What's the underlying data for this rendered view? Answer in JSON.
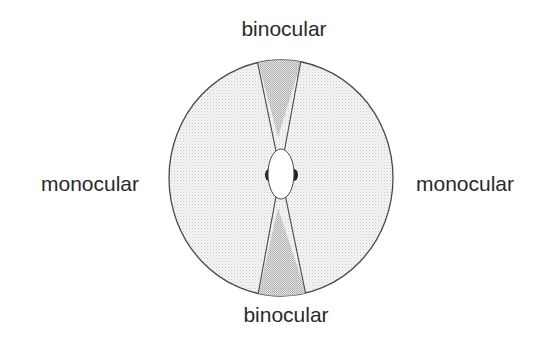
{
  "diagram": {
    "labels": {
      "top": "binocular",
      "bottom": "binocular",
      "left": "monocular",
      "right": "monocular"
    },
    "regions": [
      {
        "name": "binocular-front",
        "shading": "dark-stipple"
      },
      {
        "name": "binocular-rear",
        "shading": "dark-stipple"
      },
      {
        "name": "monocular-left",
        "shading": "light-stipple"
      },
      {
        "name": "monocular-right",
        "shading": "light-stipple"
      }
    ],
    "colors": {
      "outline": "#4a4a4a",
      "text": "#2a2a2a",
      "binocular_fill": "#d4d4d4",
      "monocular_fill": "#efefef",
      "ear": "#222222",
      "head": "#ffffff"
    }
  }
}
